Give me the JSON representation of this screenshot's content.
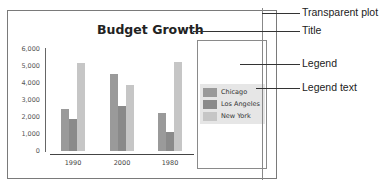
{
  "chart_data": {
    "type": "bar",
    "title": "Budget Growth",
    "xlabel": "",
    "ylabel": "",
    "categories": [
      "1990",
      "2000",
      "1980"
    ],
    "series": [
      {
        "name": "Chicago",
        "values": [
          2450,
          4550,
          2250
        ],
        "color": "#9a9a9a"
      },
      {
        "name": "Los Angeles",
        "values": [
          1900,
          2650,
          1100
        ],
        "color": "#8a8a8a"
      },
      {
        "name": "New York",
        "values": [
          5150,
          3900,
          5250
        ],
        "color": "#c6c6c6"
      }
    ],
    "yticks": [
      "0",
      "1,000",
      "2,000",
      "3,000",
      "4,000",
      "5,000",
      "6,000"
    ],
    "ylim": [
      0,
      6000
    ],
    "grid": false,
    "legend_position": "right"
  },
  "callouts": [
    {
      "label": "Transparent plot"
    },
    {
      "label": "Title"
    },
    {
      "label": "Legend"
    },
    {
      "label": "Legend text"
    }
  ]
}
